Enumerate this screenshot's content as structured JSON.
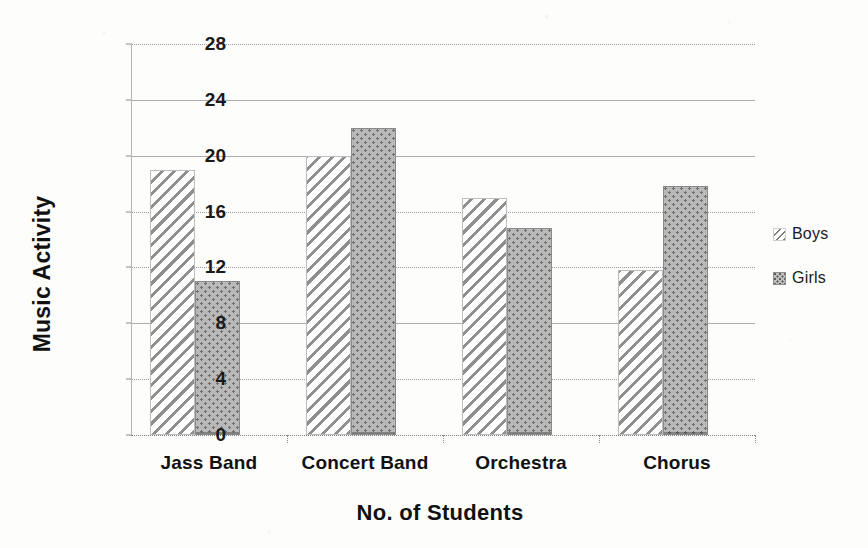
{
  "chart_data": {
    "type": "bar",
    "title": "",
    "xlabel": "No. of Students",
    "ylabel": "Music Activity",
    "categories": [
      "Jass Band",
      "Concert Band",
      "Orchestra",
      "Chorus"
    ],
    "series": [
      {
        "name": "Boys",
        "values": [
          19,
          20,
          17,
          11.8
        ],
        "pattern": "diagonal-hatch",
        "color": "#8f8f8f"
      },
      {
        "name": "Girls",
        "values": [
          11,
          22,
          14.8,
          17.8
        ],
        "pattern": "dotted-fill",
        "color": "#b9b9b9"
      }
    ],
    "ylim": [
      0,
      28
    ],
    "ytick_step": 4,
    "yticks": [
      "0",
      "4",
      "8",
      "12",
      "16",
      "20",
      "24",
      "28"
    ],
    "grid": true,
    "legend_position": "right",
    "background": "#fdfdfc"
  },
  "legend": {
    "items": [
      {
        "label": "Boys",
        "swatch": "diagonal-hatch-swatch"
      },
      {
        "label": "Girls",
        "swatch": "dotted-fill-swatch"
      }
    ]
  }
}
